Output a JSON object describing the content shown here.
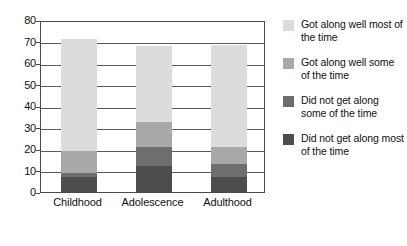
{
  "chart_data": {
    "type": "bar",
    "subtype": "stacked-bar",
    "title": "",
    "xlabel": "",
    "ylabel": "",
    "ylim": [
      0,
      80
    ],
    "ytick_step": 10,
    "yticks": [
      0,
      10,
      20,
      30,
      40,
      50,
      60,
      70,
      80
    ],
    "ytick_labels": [
      "0",
      "10",
      "20",
      "30",
      "40",
      "50",
      "60",
      "70",
      "80"
    ],
    "grid": true,
    "grid_axis": "y",
    "legend_position": "right",
    "categories": [
      "Childhood",
      "Adolescence",
      "Adulthood"
    ],
    "series": [
      {
        "name": "Did not get along most of the time",
        "color": "#4d4d4d",
        "values": [
          7,
          12,
          7
        ]
      },
      {
        "name": "Did not get along some of the time",
        "color": "#6e6e6e",
        "values": [
          2,
          9,
          6
        ]
      },
      {
        "name": "Got along well some of the time",
        "color": "#a8a8a8",
        "values": [
          10,
          11.5,
          8
        ]
      },
      {
        "name": "Got along well most of the time",
        "color": "#dcdcdc",
        "values": [
          52,
          35.5,
          47.5
        ]
      }
    ],
    "stack_order_bottom_to_top": [
      "Did not get along most of the time",
      "Did not get along some of the time",
      "Got along well some of the time",
      "Got along well most of the time"
    ],
    "totals": [
      71,
      68,
      68.5
    ]
  },
  "legend": {
    "items": [
      {
        "label": "Got along well most of the time",
        "color": "#dcdcdc"
      },
      {
        "label": "Got along well some of the time",
        "color": "#a8a8a8"
      },
      {
        "label": "Did not get along some of the time",
        "color": "#6e6e6e"
      },
      {
        "label": "Did not get along most of the time",
        "color": "#4d4d4d"
      }
    ]
  },
  "colors": {
    "axis": "#4a4a4a",
    "grid": "#5a5a5a",
    "text": "#111111",
    "background": "#ffffff"
  }
}
